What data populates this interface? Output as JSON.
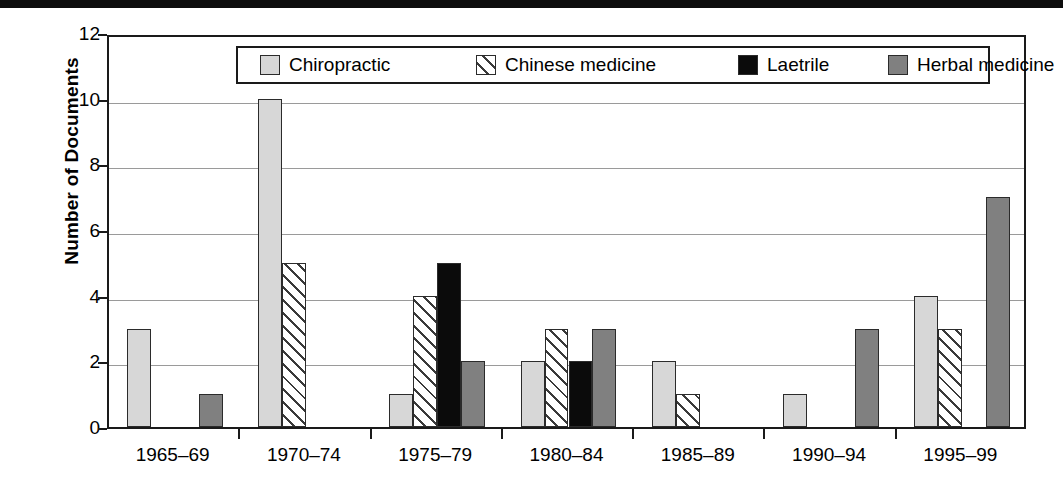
{
  "chart_data": {
    "type": "bar",
    "title": "",
    "xlabel": "",
    "ylabel": "Number of Documents",
    "ylim": [
      0,
      12
    ],
    "yticks": [
      0,
      2,
      4,
      6,
      8,
      10,
      12
    ],
    "grid": true,
    "legend_position": "top-center",
    "categories": [
      "1965–69",
      "1970–74",
      "1975–79",
      "1980–84",
      "1985–89",
      "1990–94",
      "1995–99"
    ],
    "series": [
      {
        "name": "Chiropractic",
        "pattern": "solid-light-gray",
        "color": "#d7d7d7",
        "values": [
          3,
          10,
          1,
          2,
          2,
          1,
          4
        ]
      },
      {
        "name": "Chinese medicine",
        "pattern": "diagonal-hatch",
        "color": "#ffffff",
        "values": [
          0,
          5,
          4,
          3,
          1,
          0,
          3
        ]
      },
      {
        "name": "Laetrile",
        "pattern": "solid-black",
        "color": "#0b0b0b",
        "values": [
          0,
          0,
          5,
          2,
          0,
          0,
          0
        ]
      },
      {
        "name": "Herbal medicine",
        "pattern": "solid-dark-gray",
        "color": "#808080",
        "values": [
          1,
          0,
          2,
          3,
          0,
          3,
          7
        ]
      }
    ]
  },
  "legend": {
    "items": [
      {
        "label": "Chiropractic"
      },
      {
        "label": "Chinese medicine"
      },
      {
        "label": "Laetrile"
      },
      {
        "label": "Herbal medicine"
      }
    ]
  },
  "axis": {
    "y_title": "Number of Documents",
    "y_tick_labels": [
      "12",
      "10",
      "8",
      "6",
      "4",
      "2",
      "0"
    ],
    "x_tick_labels": [
      "1965–69",
      "1970–74",
      "1975–79",
      "1980–84",
      "1985–89",
      "1990–94",
      "1995–99"
    ]
  },
  "colors": {
    "axis": "#1a1a1a",
    "grid": "#9a9a9a",
    "chiropractic": "#d7d7d7",
    "chinese_medicine": "#ffffff",
    "laetrile": "#0b0b0b",
    "herbal_medicine": "#808080",
    "top_bar": "#0d0d0d"
  }
}
